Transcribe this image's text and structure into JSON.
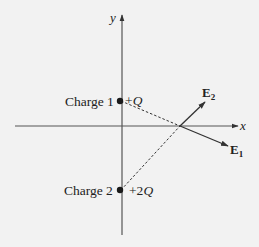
{
  "diagram": {
    "axes": {
      "x_label": "x",
      "y_label": "y"
    },
    "charges": [
      {
        "name": "Charge 1",
        "value": "+Q",
        "sign": "+",
        "magnitude": "Q",
        "position": "positive y-axis"
      },
      {
        "name": "Charge 2",
        "value": "+2Q",
        "sign": "+2",
        "magnitude": "Q",
        "position": "negative y-axis"
      }
    ],
    "fields": [
      {
        "label": "E",
        "subscript": "1",
        "direction": "down-right, away from Charge 1"
      },
      {
        "label": "E",
        "subscript": "2",
        "direction": "up-right, away from Charge 2"
      }
    ],
    "field_point": "point on positive x-axis",
    "colors": {
      "background": "#f2f2f2",
      "ink": "#222222",
      "axis": "#555555"
    }
  }
}
